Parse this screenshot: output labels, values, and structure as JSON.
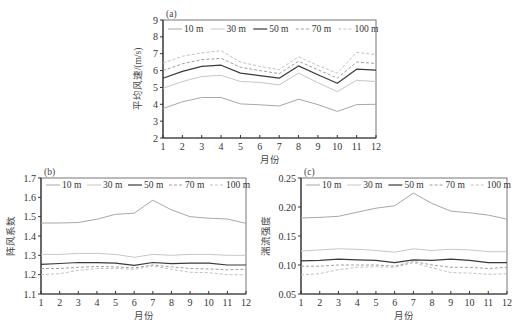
{
  "chart_data": [
    {
      "id": "a",
      "type": "line",
      "panel_label": "(a)",
      "title": "",
      "xlabel": "月份",
      "ylabel": "平均风速/(m/s)",
      "xlim": [
        1,
        12
      ],
      "ylim": [
        2,
        9
      ],
      "x": [
        1,
        2,
        3,
        4,
        5,
        6,
        7,
        8,
        9,
        10,
        11,
        12
      ],
      "yticks": [
        2,
        3,
        4,
        5,
        6,
        7,
        8,
        9
      ],
      "ytick_labels": [
        "2",
        "3",
        "4",
        "5",
        "6",
        "7",
        "8",
        "9"
      ],
      "legend_position": "top inside",
      "series": [
        {
          "name": "10 m",
          "style": "solid-thin",
          "values": [
            3.75,
            4.15,
            4.4,
            4.4,
            4.02,
            3.97,
            3.9,
            4.3,
            3.98,
            3.58,
            3.98,
            4.0
          ]
        },
        {
          "name": "30 m",
          "style": "solid-light",
          "values": [
            4.95,
            5.35,
            5.65,
            5.72,
            5.35,
            5.3,
            5.15,
            5.85,
            5.28,
            4.75,
            5.42,
            5.35
          ]
        },
        {
          "name": "50 m",
          "style": "solid-dark",
          "values": [
            5.55,
            5.95,
            6.25,
            6.32,
            5.85,
            5.7,
            5.55,
            6.28,
            5.75,
            5.25,
            6.08,
            6.02
          ]
        },
        {
          "name": "70 m",
          "style": "dashed",
          "values": [
            6.0,
            6.4,
            6.65,
            6.72,
            6.2,
            6.0,
            5.82,
            6.55,
            6.05,
            5.55,
            6.5,
            6.42
          ]
        },
        {
          "name": "100 m",
          "style": "dashed-light",
          "values": [
            6.45,
            6.85,
            7.05,
            7.18,
            6.5,
            6.25,
            6.05,
            6.82,
            6.3,
            5.85,
            7.08,
            6.95
          ]
        }
      ]
    },
    {
      "id": "b",
      "type": "line",
      "panel_label": "(b)",
      "title": "",
      "xlabel": "月份",
      "ylabel": "阵风系数",
      "xlim": [
        1,
        12
      ],
      "ylim": [
        1.1,
        1.7
      ],
      "x": [
        1,
        2,
        3,
        4,
        5,
        6,
        7,
        8,
        9,
        10,
        11,
        12
      ],
      "yticks": [
        1.1,
        1.2,
        1.3,
        1.4,
        1.5,
        1.6,
        1.7
      ],
      "ytick_labels": [
        "1.1",
        "1.2",
        "1.3",
        "1.4",
        "1.5",
        "1.6",
        "1.7"
      ],
      "legend_position": "top inside",
      "series": [
        {
          "name": "10 m",
          "style": "solid-thin",
          "values": [
            1.467,
            1.467,
            1.47,
            1.487,
            1.512,
            1.518,
            1.585,
            1.535,
            1.5,
            1.492,
            1.488,
            1.465
          ]
        },
        {
          "name": "30 m",
          "style": "solid-light",
          "values": [
            1.305,
            1.305,
            1.31,
            1.31,
            1.305,
            1.29,
            1.305,
            1.3,
            1.305,
            1.305,
            1.3,
            1.3
          ]
        },
        {
          "name": "50 m",
          "style": "solid-dark",
          "values": [
            1.253,
            1.258,
            1.263,
            1.262,
            1.26,
            1.248,
            1.263,
            1.257,
            1.26,
            1.26,
            1.25,
            1.25
          ]
        },
        {
          "name": "70 m",
          "style": "dashed",
          "values": [
            1.232,
            1.232,
            1.238,
            1.242,
            1.24,
            1.235,
            1.25,
            1.24,
            1.232,
            1.23,
            1.225,
            1.228
          ]
        },
        {
          "name": "100 m",
          "style": "dashed-light",
          "values": [
            1.2,
            1.205,
            1.222,
            1.232,
            1.232,
            1.228,
            1.245,
            1.228,
            1.212,
            1.21,
            1.2,
            1.2
          ]
        }
      ]
    },
    {
      "id": "c",
      "type": "line",
      "panel_label": "(c)",
      "title": "",
      "xlabel": "月份",
      "ylabel": "湍流强度",
      "xlim": [
        1,
        12
      ],
      "ylim": [
        0.05,
        0.25
      ],
      "x": [
        1,
        2,
        3,
        4,
        5,
        6,
        7,
        8,
        9,
        10,
        11,
        12
      ],
      "yticks": [
        0.05,
        0.1,
        0.15,
        0.2,
        0.25
      ],
      "ytick_labels": [
        "0.05",
        "0.10",
        "0.15",
        "0.20",
        "0.25"
      ],
      "legend_position": "top inside",
      "series": [
        {
          "name": "10 m",
          "style": "solid-thin",
          "values": [
            0.181,
            0.182,
            0.184,
            0.191,
            0.198,
            0.202,
            0.224,
            0.206,
            0.193,
            0.19,
            0.186,
            0.179
          ]
        },
        {
          "name": "30 m",
          "style": "solid-light",
          "values": [
            0.124,
            0.126,
            0.128,
            0.127,
            0.125,
            0.122,
            0.128,
            0.125,
            0.127,
            0.126,
            0.123,
            0.123
          ]
        },
        {
          "name": "50 m",
          "style": "solid-dark",
          "values": [
            0.107,
            0.108,
            0.11,
            0.109,
            0.108,
            0.104,
            0.109,
            0.108,
            0.11,
            0.108,
            0.104,
            0.104
          ]
        },
        {
          "name": "70 m",
          "style": "dashed",
          "values": [
            0.098,
            0.098,
            0.1,
            0.1,
            0.1,
            0.098,
            0.106,
            0.1,
            0.096,
            0.096,
            0.094,
            0.096
          ]
        },
        {
          "name": "100 m",
          "style": "dashed-light",
          "values": [
            0.083,
            0.085,
            0.092,
            0.096,
            0.097,
            0.096,
            0.104,
            0.095,
            0.087,
            0.086,
            0.084,
            0.085
          ]
        }
      ]
    }
  ],
  "series_styles": {
    "solid-thin": {
      "color": "#a8a8a8",
      "width": 1.0,
      "dash": ""
    },
    "solid-light": {
      "color": "#c6c6c6",
      "width": 1.0,
      "dash": ""
    },
    "solid-dark": {
      "color": "#3a3a3a",
      "width": 1.2,
      "dash": ""
    },
    "dashed": {
      "color": "#a0a0a0",
      "width": 1.0,
      "dash": "3,2"
    },
    "dashed-light": {
      "color": "#c2c2c2",
      "width": 1.0,
      "dash": "3,2"
    }
  },
  "layout": {
    "panels": {
      "a": {
        "left": 163,
        "top": 20,
        "right": 376,
        "bottom": 138
      },
      "b": {
        "left": 41,
        "top": 178,
        "right": 246,
        "bottom": 294
      },
      "c": {
        "left": 301,
        "top": 178,
        "right": 507,
        "bottom": 294
      }
    }
  }
}
